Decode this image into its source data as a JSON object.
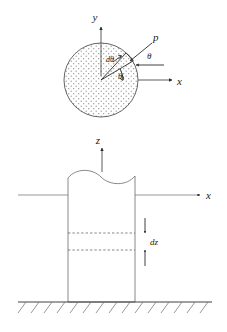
{
  "figure": {
    "colors": {
      "ink": "#2a2a2a",
      "line": "#4a4a4a",
      "thin_line": "#6a6a6a",
      "dash": "#555555",
      "stipple_dot": "#8a8a8a",
      "background": "#ffffff"
    },
    "top_view": {
      "name": "circular cross-section plan view",
      "labels": {
        "y_axis": "y",
        "x_axis": "x",
        "pressure": "p",
        "theta_outer": "θ",
        "theta_inner": "θ",
        "d_theta": "dθ"
      },
      "circle": {
        "cx": 101,
        "cy": 80,
        "r": 37,
        "fill": "stippled"
      },
      "wedge": {
        "angle_deg": 30,
        "d_angle_deg": 17
      }
    },
    "side_view": {
      "name": "column elevation view",
      "labels": {
        "z_axis": "z",
        "x_axis": "x",
        "dz": "dz"
      },
      "column": {
        "left": 68,
        "right": 135,
        "top": 176,
        "bottom": 302
      },
      "ground_line_y": 302,
      "dz_top_y": 233,
      "dz_bottom_y": 250
    }
  }
}
